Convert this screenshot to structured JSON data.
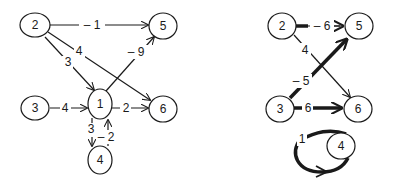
{
  "colors": {
    "ink": "#1a1a1a",
    "background": "#ffffff"
  },
  "left_graph": {
    "nodes": [
      {
        "id": "2",
        "label": "2"
      },
      {
        "id": "5",
        "label": "5"
      },
      {
        "id": "1",
        "label": "1"
      },
      {
        "id": "3",
        "label": "3"
      },
      {
        "id": "6",
        "label": "6"
      },
      {
        "id": "4",
        "label": "4"
      }
    ],
    "edges": [
      {
        "from": "2",
        "to": "5",
        "weight": "– 1"
      },
      {
        "from": "2",
        "to": "6",
        "weight": "4"
      },
      {
        "from": "2",
        "to": "1",
        "weight": "3"
      },
      {
        "from": "1",
        "to": "5",
        "weight": "– 9"
      },
      {
        "from": "3",
        "to": "1",
        "weight": "4"
      },
      {
        "from": "1",
        "to": "6",
        "weight": "2"
      },
      {
        "from": "1",
        "to": "4",
        "weight": "3"
      },
      {
        "from": "4",
        "to": "1",
        "weight": "– 2"
      }
    ]
  },
  "right_graph": {
    "nodes": [
      {
        "id": "2",
        "label": "2"
      },
      {
        "id": "5",
        "label": "5"
      },
      {
        "id": "3",
        "label": "3"
      },
      {
        "id": "6",
        "label": "6"
      },
      {
        "id": "4",
        "label": "4"
      }
    ],
    "edges": [
      {
        "from": "2",
        "to": "5",
        "weight": "– 6",
        "thick": true
      },
      {
        "from": "2",
        "to": "6",
        "weight": "4",
        "thick": false
      },
      {
        "from": "3",
        "to": "5",
        "weight": "– 5",
        "thick": true
      },
      {
        "from": "3",
        "to": "6",
        "weight": "6",
        "thick": true
      },
      {
        "from": "4",
        "to": "4",
        "weight": "1",
        "thick": true
      }
    ]
  }
}
